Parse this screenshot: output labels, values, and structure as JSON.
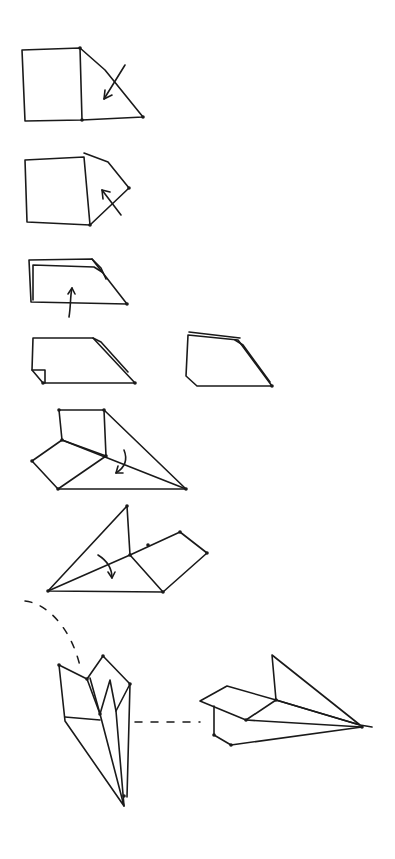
{
  "colors": {
    "ink": "#1a1a1a",
    "paper": "#ffffff"
  },
  "steps": [
    {
      "id": "step-1-fold-corner-down",
      "paths": [
        "M22,50 L80,48 L82,120 L25,121 Z",
        "M80,48 L105,70 L143,117 L82,120"
      ],
      "arrows": [
        {
          "path": "M125,65 L104,99",
          "head": "M104,99 L105,90 M104,99 L112,95"
        }
      ],
      "dots": [
        [
          80,
          48
        ],
        [
          82,
          120
        ],
        [
          143,
          117
        ]
      ]
    },
    {
      "id": "step-2-fold-corner-back",
      "paths": [
        "M25,160 L84,157 L90,225 L27,222 Z",
        "M84,153 L108,162 L129,188 L90,225"
      ],
      "arrows": [
        {
          "path": "M121,215 L102,190",
          "head": "M102,190 L103,199 M102,190 L110,192"
        }
      ],
      "dots": [
        [
          129,
          188
        ],
        [
          90,
          225
        ]
      ]
    },
    {
      "id": "step-3-fold-up-edge",
      "paths": [
        "M29,260 L92,259 L127,304 L31,302 Z",
        "M33,265 L33,300 M33,265 L94,267 L102,272",
        "M92,259 L101,268 L106,279"
      ],
      "arrows": [
        {
          "path": "M69,317 C71,305 70,297 72,288",
          "head": "M72,288 L68,294 M72,288 L75,294"
        }
      ],
      "dots": [
        [
          127,
          304
        ]
      ]
    },
    {
      "id": "step-4a-folded-flap-front",
      "paths": [
        "M33,338 L93,338 L135,383 L43,383 L32,370 Z",
        "M32,370 L45,370 L45,383",
        "M93,338 L101,342 L128,372"
      ],
      "arrows": [],
      "dots": [
        [
          135,
          383
        ],
        [
          43,
          383
        ]
      ]
    },
    {
      "id": "step-4b-folded-flap-back",
      "paths": [
        "M188,335 L238,340 L272,386 L197,386 L186,376 Z",
        "M189,332 L240,338",
        "M235,340 L243,345 L270,382"
      ],
      "arrows": [],
      "dots": [
        [
          272,
          386
        ]
      ]
    },
    {
      "id": "step-5-fold-wing-down",
      "paths": [
        "M59,410 L104,410 L106,456 L62,440 Z",
        "M104,410 L186,489 L58,489 L32,461 L62,440",
        "M62,440 L186,489",
        "M106,456 L58,489"
      ],
      "arrows": [
        {
          "path": "M124,450 C128,460 124,468 116,473",
          "head": "M116,473 L118,466 M116,473 L123,473"
        }
      ],
      "dots": [
        [
          59,
          410
        ],
        [
          104,
          410
        ],
        [
          62,
          440
        ],
        [
          106,
          456
        ],
        [
          32,
          461
        ],
        [
          58,
          489
        ],
        [
          186,
          489
        ]
      ]
    },
    {
      "id": "step-6-fold-other-wing",
      "paths": [
        "M48,591 L127,506 L130,555 L180,532 L207,553 L163,592 Z",
        "M48,591 L130,555",
        "M130,555 L163,592"
      ],
      "arrows": [
        {
          "path": "M98,555 C106,560 112,568 112,578",
          "head": "M112,578 L108,572 M112,578 L115,572"
        }
      ],
      "dots": [
        [
          127,
          506
        ],
        [
          130,
          555
        ],
        [
          148,
          545
        ],
        [
          180,
          532
        ],
        [
          207,
          553
        ],
        [
          163,
          592
        ],
        [
          48,
          591
        ]
      ]
    },
    {
      "id": "step-7a-airplane-front-view",
      "paths": [
        "M59,665 L87,679 L100,714 L124,806 L65,721 Z",
        "M65,717 L100,720",
        "M87,679 L103,656 L130,684 L127,797",
        "M90,678 L100,714",
        "M100,714 L110,680 L116,711 L124,806",
        "M130,684 L116,711"
      ],
      "arrows": [],
      "dots": [
        [
          59,
          665
        ],
        [
          87,
          679
        ],
        [
          103,
          656
        ],
        [
          130,
          684
        ],
        [
          100,
          714
        ],
        [
          124,
          796
        ]
      ]
    },
    {
      "id": "step-7b-airplane-side-view",
      "paths": [
        "M272,655 L276,700 L360,725 Z",
        "M200,701 L227,686 L276,700 L246,720 Z",
        "M246,720 L362,727",
        "M214,706 L214,735 L231,745 L362,727",
        "M276,700 L360,725 L372,727"
      ],
      "arrows": [],
      "dots": [
        [
          276,
          700
        ],
        [
          246,
          720
        ],
        [
          214,
          735
        ],
        [
          231,
          745
        ],
        [
          362,
          727
        ]
      ]
    }
  ],
  "connectors": [
    {
      "id": "trajectory-curve",
      "path": "M25,601 C45,603 70,625 80,666"
    },
    {
      "id": "view-link",
      "path": "M135,722 L200,722"
    }
  ]
}
